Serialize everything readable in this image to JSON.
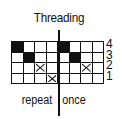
{
  "title": "Threading",
  "shafts": [
    "4",
    "3",
    "2",
    "1"
  ],
  "grid": {
    "columns": 8,
    "rows": [
      {
        "shaft": "4",
        "cells": [
          "filled",
          "empty",
          "empty",
          "empty",
          "filled",
          "empty",
          "empty",
          "empty"
        ]
      },
      {
        "shaft": "3",
        "cells": [
          "empty",
          "filled",
          "empty",
          "empty",
          "empty",
          "filled",
          "empty",
          "empty"
        ]
      },
      {
        "shaft": "2",
        "cells": [
          "empty",
          "empty",
          "x",
          "empty",
          "empty",
          "empty",
          "x",
          "empty"
        ]
      },
      {
        "shaft": "1",
        "cells": [
          "empty",
          "empty",
          "empty",
          "x",
          "empty",
          "empty",
          "empty",
          "empty"
        ]
      }
    ]
  },
  "labels": {
    "repeat": "repeat",
    "once": "once"
  },
  "colors": {
    "ink": "#111111",
    "background": "#ffffff"
  }
}
